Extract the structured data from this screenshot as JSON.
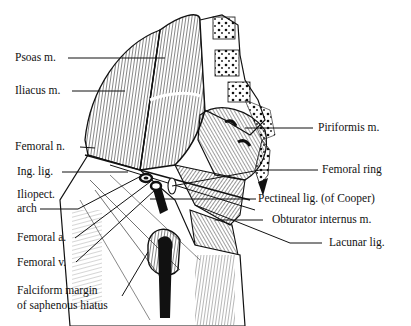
{
  "figure": {
    "colors": {
      "ink": "#111111",
      "background": "#ffffff"
    },
    "labels_left": [
      {
        "id": "psoas",
        "text": "Psoas m."
      },
      {
        "id": "iliacus",
        "text": "Iliacus m."
      },
      {
        "id": "femoral-n",
        "text": "Femoral n."
      },
      {
        "id": "ing-lig",
        "text": "Ing. lig."
      },
      {
        "id": "iliopect-1",
        "text": "Iliopect."
      },
      {
        "id": "iliopect-2",
        "text": "arch"
      },
      {
        "id": "femoral-a",
        "text": "Femoral a."
      },
      {
        "id": "femoral-v",
        "text": "Femoral v."
      },
      {
        "id": "falciform-1",
        "text": "Falciform margin"
      },
      {
        "id": "falciform-2",
        "text": "of saphenous hiatus"
      }
    ],
    "labels_right": [
      {
        "id": "piriformis",
        "text": "Piriformis m."
      },
      {
        "id": "femoral-ring",
        "text": "Femoral ring"
      },
      {
        "id": "pectineal",
        "text": "Pectineal lig. (of Cooper)"
      },
      {
        "id": "obturator",
        "text": "Obturator internus m."
      },
      {
        "id": "lacunar",
        "text": "Lacunar lig."
      }
    ]
  }
}
